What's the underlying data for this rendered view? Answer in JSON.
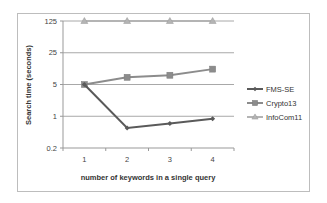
{
  "chart_data": {
    "type": "line",
    "title": "",
    "xlabel": "number of keywords in a single query",
    "ylabel": "Search time (seconds)",
    "yscale": "log",
    "ylim": [
      0.2,
      125
    ],
    "yticks": [
      "125",
      "25",
      "5",
      "1",
      "0.2"
    ],
    "categories": [
      "1",
      "2",
      "3",
      "4"
    ],
    "grid": true,
    "legend_position": "right",
    "series": [
      {
        "name": "FMS-SE",
        "values": [
          5,
          0.55,
          0.69,
          0.88
        ],
        "color": "#5a5a5a",
        "marker": "diamond"
      },
      {
        "name": "Crypto13",
        "values": [
          5,
          7.2,
          8.0,
          10.9
        ],
        "color": "#8c8c8c",
        "marker": "square"
      },
      {
        "name": "InfoCom11",
        "values": [
          125,
          125,
          125,
          125
        ],
        "color": "#b4b4b4",
        "marker": "triangle"
      }
    ]
  }
}
